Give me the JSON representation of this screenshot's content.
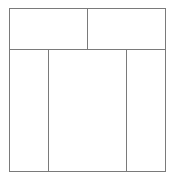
{
  "diagram": {
    "type": "wireframe-layout",
    "line_color": "#7a7a7a",
    "background": "#ffffff",
    "rows": [
      {
        "name": "top-row",
        "cells": [
          {
            "name": "top-left-panel",
            "label": ""
          },
          {
            "name": "top-right-panel",
            "label": ""
          }
        ]
      },
      {
        "name": "bottom-row",
        "cells": [
          {
            "name": "bottom-left-panel",
            "label": ""
          },
          {
            "name": "bottom-center-panel",
            "label": ""
          },
          {
            "name": "bottom-right-panel",
            "label": ""
          }
        ]
      }
    ]
  }
}
